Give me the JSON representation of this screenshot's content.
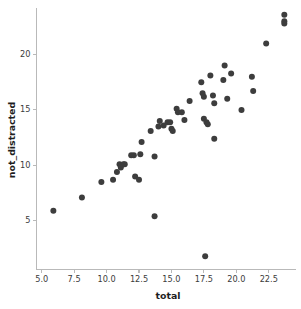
{
  "chart_data": {
    "type": "scatter",
    "title": "",
    "xlabel": "total",
    "ylabel": "not_distracted",
    "xlim": [
      4.6,
      24.6
    ],
    "ylim": [
      0.6,
      24.2
    ],
    "grid": false,
    "legend": null,
    "marker": {
      "shape": "circle",
      "color": "#3d3d3d",
      "size": 3.0
    },
    "xticks": [
      5.0,
      7.5,
      10.0,
      12.5,
      15.0,
      17.5,
      20.0,
      22.5
    ],
    "xtick_labels": [
      "5.0",
      "7.5",
      "10.0",
      "12.5",
      "15.0",
      "17.5",
      "20.0",
      "22.5"
    ],
    "yticks": [
      5,
      10,
      15,
      20
    ],
    "ytick_labels": [
      "5",
      "10",
      "15",
      "20"
    ],
    "points": [
      {
        "x": 5.9,
        "y": 5.9
      },
      {
        "x": 8.1,
        "y": 7.1
      },
      {
        "x": 9.6,
        "y": 8.5
      },
      {
        "x": 10.5,
        "y": 8.7
      },
      {
        "x": 10.8,
        "y": 9.4
      },
      {
        "x": 11.0,
        "y": 10.1
      },
      {
        "x": 11.1,
        "y": 9.8
      },
      {
        "x": 11.3,
        "y": 10.1
      },
      {
        "x": 11.4,
        "y": 10.1
      },
      {
        "x": 11.9,
        "y": 10.9
      },
      {
        "x": 12.1,
        "y": 10.9
      },
      {
        "x": 12.2,
        "y": 9.0
      },
      {
        "x": 12.5,
        "y": 8.7
      },
      {
        "x": 12.6,
        "y": 11.0
      },
      {
        "x": 12.7,
        "y": 12.1
      },
      {
        "x": 13.4,
        "y": 13.1
      },
      {
        "x": 13.7,
        "y": 10.8
      },
      {
        "x": 13.7,
        "y": 5.4
      },
      {
        "x": 14.0,
        "y": 13.5
      },
      {
        "x": 14.1,
        "y": 14.0
      },
      {
        "x": 14.4,
        "y": 13.6
      },
      {
        "x": 14.7,
        "y": 13.9
      },
      {
        "x": 14.9,
        "y": 13.9
      },
      {
        "x": 15.0,
        "y": 13.3
      },
      {
        "x": 15.1,
        "y": 13.1
      },
      {
        "x": 15.4,
        "y": 15.1
      },
      {
        "x": 15.5,
        "y": 14.8
      },
      {
        "x": 15.8,
        "y": 14.8
      },
      {
        "x": 16.0,
        "y": 14.1
      },
      {
        "x": 16.4,
        "y": 15.8
      },
      {
        "x": 17.3,
        "y": 17.5
      },
      {
        "x": 17.4,
        "y": 16.5
      },
      {
        "x": 17.5,
        "y": 16.2
      },
      {
        "x": 17.5,
        "y": 14.2
      },
      {
        "x": 17.6,
        "y": 1.8
      },
      {
        "x": 17.7,
        "y": 13.9
      },
      {
        "x": 17.8,
        "y": 13.7
      },
      {
        "x": 18.0,
        "y": 18.1
      },
      {
        "x": 18.2,
        "y": 16.3
      },
      {
        "x": 18.3,
        "y": 15.6
      },
      {
        "x": 18.3,
        "y": 12.4
      },
      {
        "x": 19.0,
        "y": 17.7
      },
      {
        "x": 19.1,
        "y": 19.0
      },
      {
        "x": 19.3,
        "y": 16.0
      },
      {
        "x": 19.6,
        "y": 18.3
      },
      {
        "x": 20.4,
        "y": 15.0
      },
      {
        "x": 21.2,
        "y": 18.0
      },
      {
        "x": 21.3,
        "y": 16.7
      },
      {
        "x": 22.3,
        "y": 21.0
      },
      {
        "x": 23.7,
        "y": 23.0
      },
      {
        "x": 23.7,
        "y": 22.8
      },
      {
        "x": 23.7,
        "y": 23.6
      }
    ]
  },
  "axes": {
    "x_title": "total",
    "y_title": "not_distracted"
  }
}
